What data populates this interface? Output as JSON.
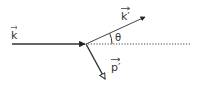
{
  "diagram": {
    "type": "scattering-vector-diagram",
    "colors": {
      "line": "#333333",
      "background": "#ffffff"
    },
    "labels": {
      "incident": "k",
      "scattered": "k′",
      "recoil": "p′",
      "angle": "θ"
    },
    "vectors": [
      {
        "name": "incident-wavevector",
        "label": "k",
        "from": [
          12,
          44
        ],
        "to": [
          86,
          44
        ],
        "arrowhead": "filled"
      },
      {
        "name": "scattered-wavevector",
        "label": "k′",
        "from": [
          86,
          44
        ],
        "to": [
          146,
          17
        ],
        "arrowhead": "filled"
      },
      {
        "name": "recoil-momentum",
        "label": "p′",
        "from": [
          86,
          44
        ],
        "to": [
          106,
          80
        ],
        "arrowhead": "open"
      }
    ],
    "reference_line": {
      "style": "dotted",
      "from": [
        86,
        44
      ],
      "to": [
        191,
        44
      ]
    },
    "angle": {
      "label": "θ",
      "between": [
        "scattered-wavevector",
        "reference_line"
      ]
    }
  }
}
